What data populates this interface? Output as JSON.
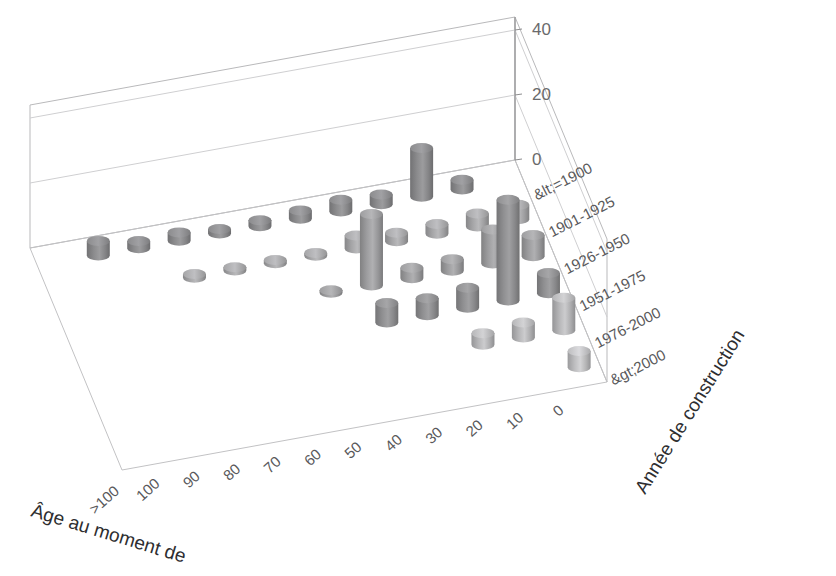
{
  "chart_data": {
    "type": "bar",
    "subtype": "3d-cylinder-bar",
    "title": "",
    "xlabel": "Âge au moment de",
    "ylabel": "Année de construction",
    "zlabel": "",
    "grid": true,
    "legend": "none",
    "zlim": [
      0,
      40
    ],
    "z_ticks": [
      "0",
      "20",
      "40"
    ],
    "z_tick_values": [
      0,
      20,
      40
    ],
    "categories": [
      ">100",
      "100",
      "90",
      "80",
      "70",
      "60",
      "50",
      "40",
      "30",
      "20",
      "10",
      "0"
    ],
    "depth_categories": [
      "&lt;=1900",
      "1901-1925",
      "1926-1950",
      "1951-1975",
      "1976-2000",
      "&gt;2000"
    ],
    "series": [
      {
        "name": "&lt;=1900",
        "values": [
          0,
          4.5,
          2.2,
          2.6,
          1.4,
          1.8,
          2.6,
          3.6,
          3.0,
          15.0,
          3.0,
          0
        ]
      },
      {
        "name": "1901-1925",
        "values": [
          0,
          0,
          0,
          1.2,
          1.0,
          1.0,
          0.9,
          4.0,
          2.6,
          3.0,
          4.0,
          4.4
        ]
      },
      {
        "name": "1926-1950",
        "values": [
          0,
          0,
          0,
          0,
          0,
          0,
          0.8,
          22.0,
          3.2,
          3.6,
          10.5,
          6.5
        ]
      },
      {
        "name": "1951-1975",
        "values": [
          0,
          0,
          0,
          0,
          0,
          0,
          0,
          6.0,
          5.2,
          6.2,
          31.0,
          6.2
        ]
      },
      {
        "name": "1976-2000",
        "values": [
          0,
          0,
          0,
          0,
          0,
          0,
          0,
          0,
          0,
          3.6,
          4.6,
          10.0
        ]
      },
      {
        "name": "&gt;2000",
        "values": [
          0,
          0,
          0,
          0,
          0,
          0,
          0,
          0,
          0,
          0,
          0,
          5.0
        ]
      }
    ],
    "bar_colors": [
      "#8b8b8d",
      "#a5a5a7",
      "#9d9d9f",
      "#8f8f91",
      "#b6b6b8",
      "#bdbdbf"
    ],
    "axis_color": "#b9b9bb",
    "text_color": "#59595b"
  },
  "axes": {
    "x_title": "Âge au moment de",
    "y_title": "Année de construction",
    "x_tick_labels": [
      ">100",
      "100",
      "90",
      "80",
      "70",
      "60",
      "50",
      "40",
      "30",
      "20",
      "10",
      "0"
    ],
    "y_tick_labels": [
      "&lt;=1900",
      "1901-1925",
      "1926-1950",
      "1951-1975",
      "1976-2000",
      "&gt;2000"
    ],
    "z_tick_labels": [
      "0",
      "20",
      "40"
    ]
  }
}
